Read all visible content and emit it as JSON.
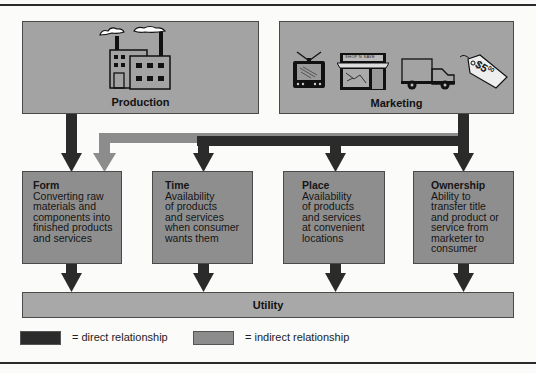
{
  "diagram": {
    "sources": [
      {
        "id": "production",
        "label": "Production",
        "icons": [
          "factory-icon"
        ]
      },
      {
        "id": "marketing",
        "label": "Marketing",
        "icons": [
          "tv-icon",
          "store-icon",
          "truck-icon",
          "price-tag-icon"
        ],
        "store_sign": "SHOP N SAVE",
        "price_tag": "$5",
        "price_tag_cents": "00"
      }
    ],
    "utilities": [
      {
        "id": "form",
        "title": "Form",
        "description": "Converting raw\nmaterials and\ncomponents into\nfinished products\nand services"
      },
      {
        "id": "time",
        "title": "Time",
        "description": "Availability\nof products\nand services\nwhen consumer\nwants them"
      },
      {
        "id": "place",
        "title": "Place",
        "description": "Availability\nof products\nand services\nat convenient\nlocations"
      },
      {
        "id": "ownership",
        "title": "Ownership",
        "description": "Ability to\ntransfer title\nand product or\nservice from\nmarketer to\nconsumer"
      }
    ],
    "target": {
      "id": "utility",
      "label": "Utility"
    },
    "relationships": [
      {
        "from": "production",
        "to": "form",
        "type": "direct"
      },
      {
        "from": "marketing",
        "to": "form",
        "type": "indirect"
      },
      {
        "from": "marketing",
        "to": "time",
        "type": "direct"
      },
      {
        "from": "marketing",
        "to": "place",
        "type": "direct"
      },
      {
        "from": "marketing",
        "to": "ownership",
        "type": "direct"
      },
      {
        "from": "form",
        "to": "utility",
        "type": "direct"
      },
      {
        "from": "time",
        "to": "utility",
        "type": "direct"
      },
      {
        "from": "place",
        "to": "utility",
        "type": "direct"
      },
      {
        "from": "ownership",
        "to": "utility",
        "type": "direct"
      }
    ]
  },
  "legend": {
    "direct": {
      "label": "= direct relationship",
      "color": "#2b2b2b"
    },
    "indirect": {
      "label": "= indirect relationship",
      "color": "#8c8c8c"
    }
  },
  "colors": {
    "direct_arrow": "#2b2b2b",
    "indirect_arrow": "#8c8c8c",
    "top_box": "#a3a3a3",
    "mid_box": "#8e8e8e",
    "utility_bar": "#a8a8a8"
  }
}
